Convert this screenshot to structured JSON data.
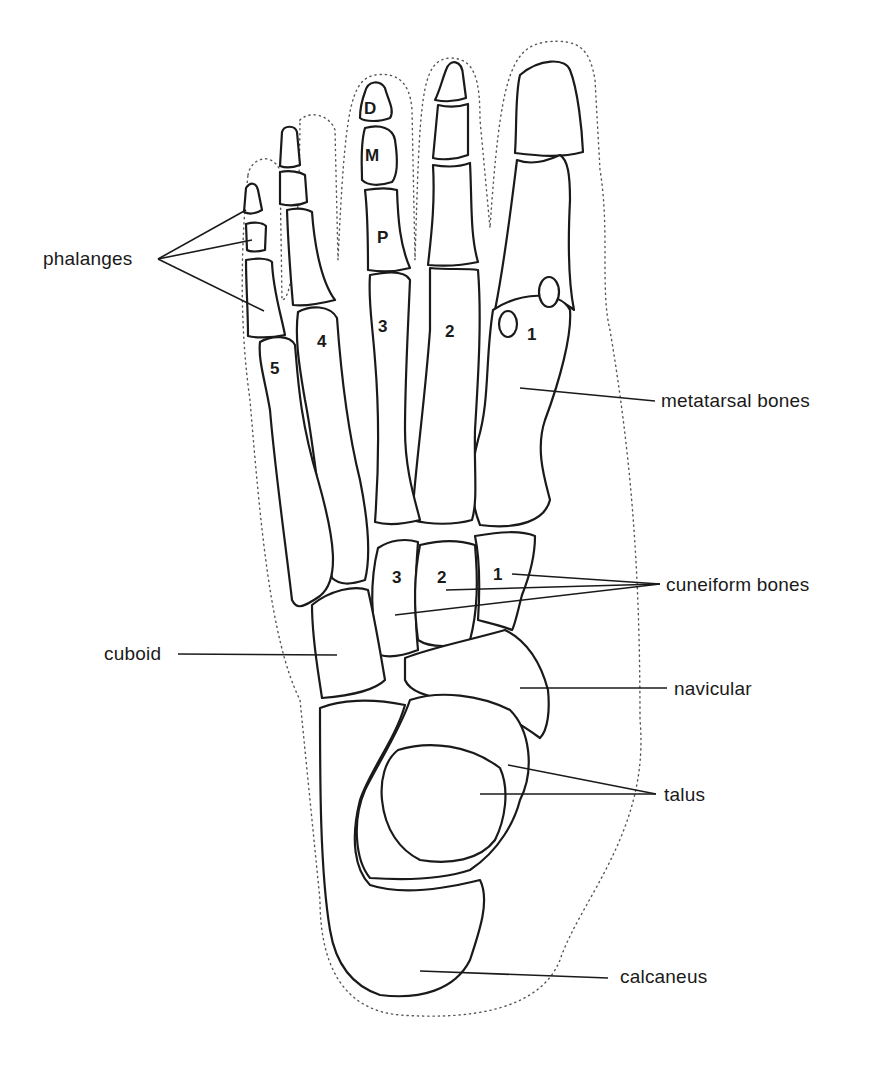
{
  "diagram": {
    "labels": {
      "phalanges": "phalanges",
      "metatarsal_bones": "metatarsal bones",
      "cuneiform_bones": "cuneiform bones",
      "cuboid": "cuboid",
      "navicular": "navicular",
      "talus": "talus",
      "calcaneus": "calcaneus"
    },
    "phalanx_letters": {
      "distal": "D",
      "middle": "M",
      "proximal": "P"
    },
    "metatarsal_numbers": [
      "1",
      "2",
      "3",
      "4",
      "5"
    ],
    "cuneiform_numbers": [
      "1",
      "2",
      "3"
    ],
    "colors": {
      "line": "#1a1a1a",
      "background": "#ffffff",
      "skin_outline": "#555555"
    }
  }
}
